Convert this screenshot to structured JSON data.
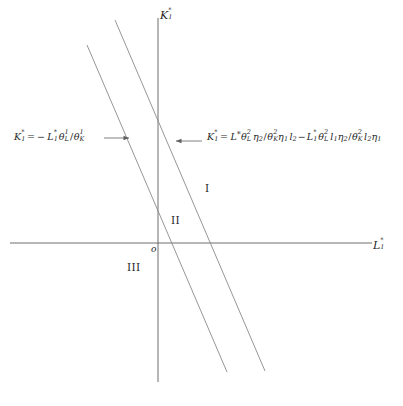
{
  "figure": {
    "type": "cartesian-diagram",
    "background": "#ffffff",
    "line_color": "#7a7a7a",
    "axis_color": "#6f6f6f",
    "text_color": "#1f1f1f"
  },
  "axes": {
    "vertical": {
      "name": "vertical-axis",
      "label_base": "K",
      "label_sub": "1",
      "label_star": "*",
      "label_text": "K₁*",
      "x": 158,
      "y_top": 18,
      "y_bottom": 382
    },
    "horizontal": {
      "name": "horizontal-axis",
      "label_base": "L",
      "label_sub": "1",
      "label_star": "*",
      "label_text": "L₁*",
      "y": 243,
      "x_left": 10,
      "x_right": 372
    },
    "origin": {
      "label": "o",
      "x": 158,
      "y": 243
    }
  },
  "lines": [
    {
      "name": "line-left",
      "id": "L1",
      "x1": 87,
      "y1": 45,
      "x2": 227,
      "y2": 372,
      "x_intercept": 158,
      "y_intercept": 243,
      "slope": -2.336,
      "passes_through_origin": true
    },
    {
      "name": "line-right",
      "id": "L2",
      "x1": 115,
      "y1": 20,
      "x2": 265,
      "y2": 371,
      "x_intercept": 208,
      "y_intercept": 142,
      "slope": -2.34,
      "passes_through_origin": false
    }
  ],
  "regions": [
    {
      "name": "region-one",
      "label": "I",
      "x": 205,
      "y": 183
    },
    {
      "name": "region-two",
      "label": "II",
      "x": 171,
      "y": 215
    },
    {
      "name": "region-three",
      "label": "III",
      "x": 127,
      "y": 262
    }
  ],
  "equations": {
    "left": {
      "name": "equation-left-line",
      "plain": "K₁* = − L₁*θ¹_L / θ¹_K",
      "parts": {
        "lhs_base": "K",
        "lhs_sub": "1",
        "lhs_star": "*",
        "equals": "=",
        "minus": "−",
        "L_base": "L",
        "L_sub": "1",
        "L_star": "*",
        "theta_num": "θ",
        "theta_num_sup": "1",
        "theta_num_sub": "L",
        "slash": "/",
        "theta_den": "θ",
        "theta_den_sup": "1",
        "theta_den_sub": "K"
      },
      "arrow": "⟶",
      "arrow_direction": "right",
      "x": 14,
      "y": 130
    },
    "right": {
      "name": "equation-right-line",
      "plain": "K₁* = L*θ²_L η₂ / θ²_K η₁ l₂ − L₁*θ²_L l₁η₂ / θ²_K l₂η₁",
      "parts": {
        "lhs_base": "K",
        "lhs_sub": "1",
        "lhs_star": "*",
        "equals": "=",
        "t1_L": "L",
        "t1_L_star": "*",
        "t1_theta": "θ",
        "t1_theta_sup": "2",
        "t1_theta_sub": "L",
        "t1_eta": "η",
        "t1_eta_sub": "2",
        "t1_slash": "/",
        "t1_theta2": "θ",
        "t1_theta2_sup": "2",
        "t1_theta2_sub": "K",
        "t1_eta2": "η",
        "t1_eta2_sub": "1",
        "t1_l": "l",
        "t1_l_sub": "2",
        "minus": "−",
        "t2_L": "L",
        "t2_L_sub": "1",
        "t2_L_star": "*",
        "t2_theta": "θ",
        "t2_theta_sup": "2",
        "t2_theta_sub": "L",
        "t2_l": "l",
        "t2_l_sub": "1",
        "t2_eta": "η",
        "t2_eta_sub": "2",
        "t2_slash": "/",
        "t2_theta2": "θ",
        "t2_theta2_sup": "2",
        "t2_theta2_sub": "K",
        "t2_l2": "l",
        "t2_l2_sub": "2",
        "t2_eta2": "η",
        "t2_eta2_sub": "1"
      },
      "arrow": "⟵",
      "arrow_direction": "left",
      "x": 207,
      "y": 130
    }
  }
}
